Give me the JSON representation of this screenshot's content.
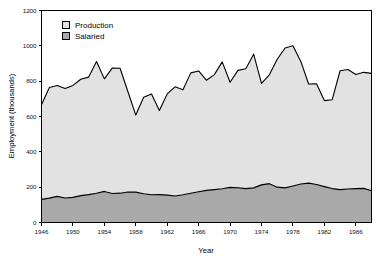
{
  "chart_data": {
    "type": "area",
    "stacked": true,
    "title": "",
    "xlabel": "Year",
    "ylabel": "Employment (thousands)",
    "xlim": [
      1946,
      1988
    ],
    "ylim": [
      0,
      1200
    ],
    "xticks": [
      1946,
      1950,
      1954,
      1958,
      1962,
      1966,
      1970,
      1974,
      1978,
      1982,
      1986
    ],
    "yticks": [
      0,
      200,
      400,
      600,
      800,
      1000,
      1200
    ],
    "grid": false,
    "legend_position": "top-left",
    "colors": {
      "production": "#e2e2e2",
      "salaried": "#a9a9a9",
      "outline": "#000000",
      "background": "#ffffff"
    },
    "x": [
      1946,
      1947,
      1948,
      1949,
      1950,
      1951,
      1952,
      1953,
      1954,
      1955,
      1956,
      1957,
      1958,
      1959,
      1960,
      1961,
      1962,
      1963,
      1964,
      1965,
      1966,
      1967,
      1968,
      1969,
      1970,
      1971,
      1972,
      1973,
      1974,
      1975,
      1976,
      1977,
      1978,
      1979,
      1980,
      1981,
      1982,
      1983,
      1984,
      1985,
      1986,
      1987,
      1988
    ],
    "series": [
      {
        "name": "Salaried",
        "values": [
          131,
          138,
          148,
          139,
          142,
          152,
          158,
          166,
          176,
          164,
          166,
          173,
          172,
          163,
          157,
          158,
          155,
          150,
          157,
          166,
          174,
          182,
          186,
          191,
          199,
          197,
          192,
          196,
          213,
          220,
          200,
          196,
          207,
          218,
          223,
          215,
          203,
          192,
          186,
          190,
          192,
          193,
          180
        ]
      },
      {
        "name": "Production",
        "values": [
          536,
          626,
          628,
          619,
          634,
          659,
          665,
          745,
          637,
          710,
          707,
          567,
          436,
          546,
          571,
          476,
          573,
          618,
          595,
          681,
          684,
          623,
          651,
          718,
          595,
          664,
          678,
          757,
          574,
          616,
          724,
          792,
          793,
          694,
          561,
          570,
          487,
          503,
          673,
          676,
          646,
          657,
          664
        ]
      }
    ],
    "totals": [
      667,
      764,
      776,
      758,
      776,
      811,
      823,
      911,
      813,
      874,
      873,
      740,
      608,
      709,
      728,
      634,
      728,
      768,
      752,
      847,
      858,
      805,
      837,
      909,
      794,
      861,
      870,
      953,
      787,
      836,
      924,
      988,
      1000,
      912,
      784,
      785,
      690,
      695,
      859,
      866,
      838,
      850,
      844
    ]
  },
  "legend": {
    "items": [
      {
        "label": "Production",
        "swatch": "#e2e2e2"
      },
      {
        "label": "Salaried",
        "swatch": "#a9a9a9"
      }
    ]
  },
  "axes": {
    "x_title": "Year",
    "y_title": "Employment (thousands)",
    "x_tick_labels": [
      "1946",
      "1950",
      "1954",
      "1958",
      "1962",
      "1966",
      "1970",
      "1974",
      "1978",
      "1982",
      "1986"
    ],
    "y_tick_labels": [
      "0",
      "200",
      "400",
      "600",
      "800",
      "1000",
      "1200"
    ]
  }
}
